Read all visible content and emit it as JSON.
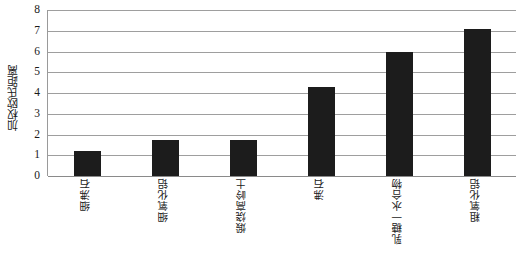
{
  "chart_data": {
    "type": "bar",
    "title": "",
    "xlabel": "",
    "ylabel": "加权欧氏距离",
    "ylim": [
      0,
      8
    ],
    "y_ticks": [
      "8",
      "7",
      "6",
      "5",
      "4",
      "3",
      "2",
      "1",
      "0"
    ],
    "grid": true,
    "legend": "none",
    "bar_color": "#1c1c1c",
    "categories": [
      "细沸石",
      "细氧化铝",
      "煅烧高岭土",
      "沸石",
      "乳糖一水合物",
      "粗氧化铝"
    ],
    "values": [
      1.22,
      1.72,
      1.74,
      4.27,
      6.0,
      7.08
    ]
  }
}
